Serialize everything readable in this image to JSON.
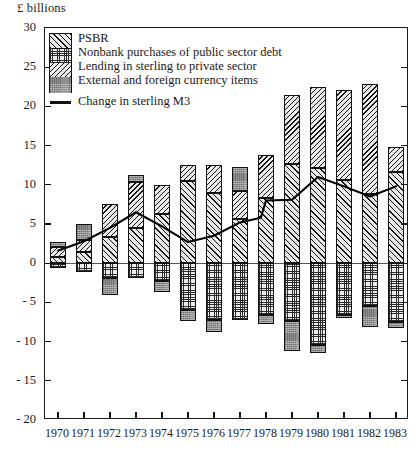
{
  "axis_title": "£ billions",
  "legend": {
    "items": [
      {
        "label": "PSBR",
        "key": "psbr",
        "swatch": "diagonal-hatch-up"
      },
      {
        "label": "Nonbank purchases of public sector debt",
        "key": "nonbank",
        "swatch": "fine-dot-grid"
      },
      {
        "label": "Lending in sterling to private sector",
        "key": "lending",
        "swatch": "diagonal-hatch-down"
      },
      {
        "label": "External and foreign currency items",
        "key": "external",
        "swatch": "solid-gray"
      }
    ],
    "line_label": "Change in sterling M3",
    "line_marker": "solid-line"
  },
  "chart_data": {
    "type": "bar",
    "title": "",
    "subtitle": "",
    "xlabel": "",
    "ylabel": "£ billions",
    "ylim": [
      -20,
      30
    ],
    "yticks": [
      30,
      25,
      20,
      15,
      10,
      5,
      0,
      "- 5",
      "- 10",
      "- 15",
      "- 20"
    ],
    "ytick_values": [
      30,
      25,
      20,
      15,
      10,
      5,
      0,
      -5,
      -10,
      -15,
      -20
    ],
    "grid": false,
    "stacked": true,
    "legend_position": "top-left",
    "categories": [
      "1970",
      "1971",
      "1972",
      "1973",
      "1974",
      "1975",
      "1976",
      "1977",
      "1978",
      "1979",
      "1980",
      "1981",
      "1982",
      "1983"
    ],
    "series": [
      {
        "name": "PSBR",
        "key": "psbr",
        "fill": "diagonal-hatch-up",
        "values": [
          0.8,
          1.4,
          3.3,
          4.5,
          6.3,
          10.5,
          9.0,
          5.6,
          8.3,
          12.6,
          12.2,
          10.6,
          8.8,
          11.6
        ]
      },
      {
        "name": "Nonbank purchases of public sector debt",
        "key": "nonbank",
        "fill": "fine-dot-grid",
        "values": [
          -0.6,
          -1.1,
          -1.9,
          -1.9,
          -2.3,
          -6.0,
          -7.3,
          -7.2,
          -6.6,
          -7.4,
          -10.4,
          -6.6,
          -5.5,
          -7.5
        ]
      },
      {
        "name": "Lending in sterling to private sector",
        "key": "lending",
        "fill": "diagonal-hatch-down",
        "values": [
          1.3,
          1.5,
          4.2,
          5.9,
          3.7,
          2.0,
          3.5,
          3.6,
          5.5,
          8.9,
          10.3,
          11.5,
          14.1,
          3.2
        ]
      },
      {
        "name": "External and foreign currency items",
        "key": "external",
        "fill": "solid-gray",
        "values": [
          0.6,
          2.1,
          -2.1,
          0.8,
          -1.4,
          -1.4,
          -1.5,
          3.1,
          -1.2,
          -3.8,
          -1.0,
          -0.4,
          -2.6,
          -0.8
        ]
      }
    ],
    "line_series": {
      "name": "Change in sterling M3",
      "values": [
        1.6,
        2.8,
        4.5,
        6.5,
        4.7,
        2.7,
        3.5,
        5.2,
        5.8,
        8.0,
        8.1,
        11.0,
        9.8,
        8.5,
        9.8
      ]
    },
    "line_x_points": [
      1970,
      1971,
      1972,
      1973,
      1974,
      1975,
      1976,
      1977,
      1977.8,
      1978,
      1979,
      1980,
      1981,
      1982,
      1983
    ]
  }
}
